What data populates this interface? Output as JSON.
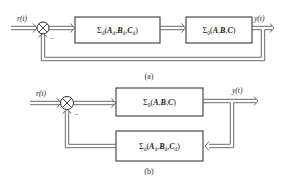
{
  "diagram_a": {
    "caption": "(a)",
    "input_label": "r(t)",
    "output_label": "y(t)",
    "feedback_sign": "−",
    "junction": "summing-junction",
    "blocks": [
      {
        "id": "disturbance-block",
        "sigma_sub": "d",
        "args": [
          {
            "base": "A",
            "sub": "d"
          },
          {
            "base": "B",
            "sub": "d"
          },
          {
            "base": "C",
            "sub": "d"
          }
        ]
      },
      {
        "id": "plant-block",
        "sigma_sub": "0",
        "args": [
          {
            "base": "A",
            "sub": ""
          },
          {
            "base": "B",
            "sub": ""
          },
          {
            "base": "C",
            "sub": ""
          }
        ]
      }
    ],
    "connections": [
      "r(t) -> summing-junction",
      "summing-junction -> Σd(Ad,Bd,Cd)",
      "Σd(Ad,Bd,Cd) -> Σ0(A,B,C)",
      "Σ0(A,B,C) -> y(t)",
      "y(t) -> summing-junction (negative feedback)"
    ]
  },
  "diagram_b": {
    "caption": "(b)",
    "input_label": "r(t)",
    "output_label": "y(t)",
    "feedback_sign": "−",
    "junction": "summing-junction",
    "blocks": [
      {
        "id": "plant-block",
        "sigma_sub": "0",
        "args": [
          {
            "base": "A",
            "sub": ""
          },
          {
            "base": "B",
            "sub": ""
          },
          {
            "base": "C",
            "sub": ""
          }
        ]
      },
      {
        "id": "feedback-block",
        "sigma_sub": "d",
        "args": [
          {
            "base": "A",
            "sub": "d"
          },
          {
            "base": "B",
            "sub": "d"
          },
          {
            "base": "C",
            "sub": "d"
          }
        ]
      }
    ],
    "connections": [
      "r(t) -> summing-junction",
      "summing-junction -> Σ0(A,B,C)",
      "Σ0(A,B,C) -> y(t)",
      "y(t) -> Σd(Ad,Bd,Cd)",
      "Σd(Ad,Bd,Cd) -> summing-junction (negative feedback)"
    ]
  },
  "symbols": {
    "sigma": "Σ",
    "open_paren": "(",
    "close_paren": ")",
    "comma": ","
  }
}
